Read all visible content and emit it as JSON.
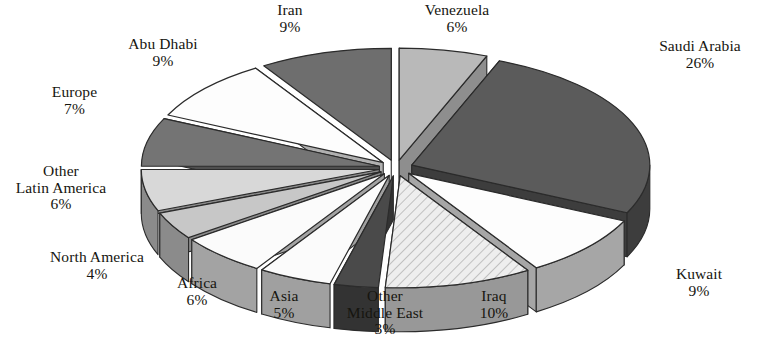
{
  "chart_data": {
    "type": "pie",
    "title": "",
    "subtitle": "",
    "xlabel": "",
    "ylabel": "",
    "exploded": true,
    "three_d": true,
    "legend_position": "none",
    "labels_outside": true,
    "units": "percent",
    "categories": [
      "Venezuela",
      "Saudi Arabia",
      "Kuwait",
      "Iraq",
      "Other Middle East",
      "Asia",
      "Africa",
      "North America",
      "Other Latin America",
      "Europe",
      "Abu Dhabi",
      "Iran"
    ],
    "values": [
      6,
      26,
      9,
      10,
      3,
      5,
      6,
      4,
      6,
      7,
      9,
      9
    ],
    "slices": [
      {
        "name": "Venezuela",
        "pct": 6,
        "label": "Venezuela",
        "value_text": "6%",
        "top_color": "#b9b9b9",
        "side_color": "#8e8e8e",
        "pattern": "none"
      },
      {
        "name": "Saudi Arabia",
        "pct": 26,
        "label": "Saudi Arabia",
        "value_text": "26%",
        "top_color": "#5b5b5b",
        "side_color": "#3d3d3d",
        "pattern": "none"
      },
      {
        "name": "Kuwait",
        "pct": 9,
        "label": "Kuwait",
        "value_text": "9%",
        "top_color": "#fdfdfd",
        "side_color": "#a6a6a6",
        "pattern": "none"
      },
      {
        "name": "Iraq",
        "pct": 10,
        "label": "Iraq",
        "value_text": "10%",
        "top_color": "#e8e8e8",
        "side_color": "#989898",
        "pattern": "hatch"
      },
      {
        "name": "Other Middle East",
        "pct": 3,
        "label": "Other Middle East",
        "value_text": "3%",
        "top_color": "#4a4a4a",
        "side_color": "#333333",
        "pattern": "none"
      },
      {
        "name": "Asia",
        "pct": 5,
        "label": "Asia",
        "value_text": "5%",
        "top_color": "#fbfbfb",
        "side_color": "#a0a0a0",
        "pattern": "none"
      },
      {
        "name": "Africa",
        "pct": 6,
        "label": "Africa",
        "value_text": "6%",
        "top_color": "#fbfbfb",
        "side_color": "#a3a3a3",
        "pattern": "none"
      },
      {
        "name": "North America",
        "pct": 4,
        "label": "North America",
        "value_text": "4%",
        "top_color": "#c7c7c7",
        "side_color": "#8b8b8b",
        "pattern": "none"
      },
      {
        "name": "Other Latin America",
        "pct": 6,
        "label": "Other Latin America",
        "value_text": "6%",
        "top_color": "#d8d8d8",
        "side_color": "#8b8b8b",
        "pattern": "none"
      },
      {
        "name": "Europe",
        "pct": 7,
        "label": "Europe",
        "value_text": "7%",
        "top_color": "#747474",
        "side_color": "#4f4f4f",
        "pattern": "none"
      },
      {
        "name": "Abu Dhabi",
        "pct": 9,
        "label": "Abu Dhabi",
        "value_text": "9%",
        "top_color": "#fdfdfd",
        "side_color": "#b0b0b0",
        "pattern": "none"
      },
      {
        "name": "Iran",
        "pct": 9,
        "label": "Iran",
        "value_text": "9%",
        "top_color": "#6e6e6e",
        "side_color": "#4b4b4b",
        "pattern": "none"
      }
    ]
  },
  "labels": {
    "iran": {
      "name": "Iran",
      "pct": "9%"
    },
    "venezuela": {
      "name": "Venezuela",
      "pct": "6%"
    },
    "abu_dhabi": {
      "name": "Abu Dhabi",
      "pct": "9%"
    },
    "saudi": {
      "name": "Saudi Arabia",
      "pct": "26%"
    },
    "europe": {
      "name": "Europe",
      "pct": "7%"
    },
    "other_latin": {
      "name": "Other",
      "name2": "Latin America",
      "pct": "6%"
    },
    "north_am": {
      "name": "North America",
      "pct": "4%"
    },
    "africa": {
      "name": "Africa",
      "pct": "6%"
    },
    "asia": {
      "name": "Asia",
      "pct": "5%"
    },
    "other_me": {
      "name": "Other",
      "name2": "Middle East",
      "pct": "3%"
    },
    "iraq": {
      "name": "Iraq",
      "pct": "10%"
    },
    "kuwait": {
      "name": "Kuwait",
      "pct": "9%"
    }
  },
  "colors": {
    "background": "#ffffff",
    "text": "#16150f",
    "outline": "#2b2b2b"
  }
}
